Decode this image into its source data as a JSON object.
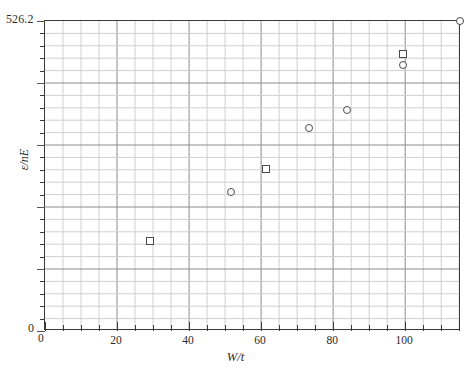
{
  "chart_data": {
    "type": "scatter",
    "title": "",
    "xlabel": "W/t",
    "ylabel": "ε/nE",
    "xlim": [
      0,
      115.5
    ],
    "ylim": [
      0,
      526.2
    ],
    "grid": true,
    "legend": "none",
    "x_ticks_major": [
      0,
      20,
      40,
      60,
      80,
      100
    ],
    "x_tick_labels": [
      "0",
      "20",
      "40",
      "60",
      "80",
      "100"
    ],
    "x_minor_step": 5,
    "y_tick_top_label": "526.2",
    "y_tick_zero_label": "0",
    "y_minor_count": 25,
    "series": [
      {
        "name": "squares",
        "marker": "square",
        "x": [
          30,
          60,
          95
        ],
        "y": [
          150,
          270,
          410
        ]
      },
      {
        "name": "circles",
        "marker": "circle",
        "x": [
          51,
          72,
          81,
          95,
          115
        ],
        "y": [
          235,
          345,
          375,
          395,
          526.2
        ]
      }
    ],
    "points": [
      {
        "series": "squares",
        "marker": "square",
        "x": 30,
        "y": 150,
        "px": 149,
        "py": 240
      },
      {
        "series": "circles",
        "marker": "circle",
        "x": 51,
        "y": 235,
        "px": 230,
        "py": 191
      },
      {
        "series": "squares",
        "marker": "square",
        "x": 60,
        "y": 270,
        "px": 265,
        "py": 168
      },
      {
        "series": "circles",
        "marker": "circle",
        "x": 72,
        "y": 345,
        "px": 308,
        "py": 127
      },
      {
        "series": "circles",
        "marker": "circle",
        "x": 81,
        "y": 375,
        "px": 346,
        "py": 109
      },
      {
        "series": "squares",
        "marker": "square",
        "x": 95,
        "y": 410,
        "px": 402,
        "py": 53
      },
      {
        "series": "circles",
        "marker": "circle",
        "x": 95,
        "y": 395,
        "px": 402,
        "py": 64
      },
      {
        "series": "circles",
        "marker": "circle",
        "x": 115,
        "y": 526.2,
        "px": 459,
        "py": 20
      }
    ]
  },
  "colors": {
    "frame": "#3a3a3a",
    "grid_major": "#8c8c8c",
    "grid_minor": "#cfcfcf",
    "marker_stroke": "#4a4a4a",
    "background": "#ffffff",
    "text": "#2b2b2b"
  }
}
